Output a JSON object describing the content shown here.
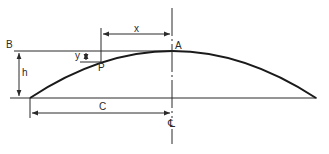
{
  "diagram": {
    "type": "parabolic arch geometry",
    "labels": {
      "B": "B",
      "A": "A",
      "P": "P",
      "h": "h",
      "x": "x",
      "y": "y",
      "C": "C",
      "centerline": "℄"
    },
    "colors": {
      "line": "#2a2a2a",
      "curve": "#1a1a1a",
      "background": "#ffffff"
    }
  }
}
